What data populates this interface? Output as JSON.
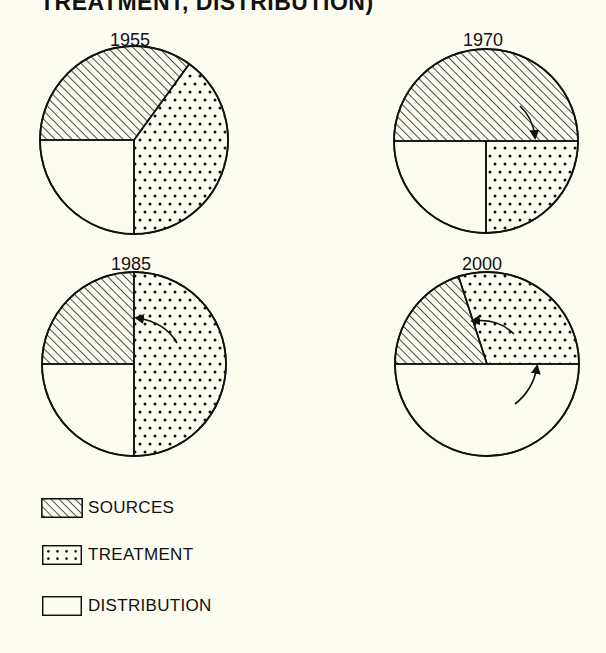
{
  "title": "TREATMENT, DISTRIBUTION)",
  "legend": {
    "items": [
      {
        "label": "SOURCES",
        "pattern": "hatch"
      },
      {
        "label": "TREATMENT",
        "pattern": "dots"
      },
      {
        "label": "DISTRIBUTION",
        "pattern": "blank"
      }
    ]
  },
  "pies": [
    {
      "year": "1955"
    },
    {
      "year": "1970"
    },
    {
      "year": "1985"
    },
    {
      "year": "2000"
    }
  ],
  "colors": {
    "background": "#fdfcf0",
    "ink": "#111111"
  },
  "chart_data": {
    "type": "pie",
    "title": "TREATMENT, DISTRIBUTION)",
    "categories": [
      "SOURCES",
      "TREATMENT",
      "DISTRIBUTION"
    ],
    "legend_position": "bottom-left",
    "charts": [
      {
        "year": "1955",
        "values": {
          "SOURCES": 35,
          "TREATMENT": 40,
          "DISTRIBUTION": 25
        }
      },
      {
        "year": "1970",
        "values": {
          "SOURCES": 50,
          "TREATMENT": 25,
          "DISTRIBUTION": 25
        }
      },
      {
        "year": "1985",
        "values": {
          "SOURCES": 25,
          "TREATMENT": 50,
          "DISTRIBUTION": 25
        }
      },
      {
        "year": "2000",
        "values": {
          "SOURCES": 20,
          "TREATMENT": 30,
          "DISTRIBUTION": 50
        }
      }
    ],
    "annotations": [
      {
        "year": "1970",
        "arrow": "sources/treatment boundary moving down to horizontal"
      },
      {
        "year": "1985",
        "arrow": "treatment boundary moving left to vertical"
      },
      {
        "year": "2000",
        "arrows": [
          "treatment boundary moving left",
          "distribution boundary moving up to horizontal"
        ]
      }
    ]
  }
}
